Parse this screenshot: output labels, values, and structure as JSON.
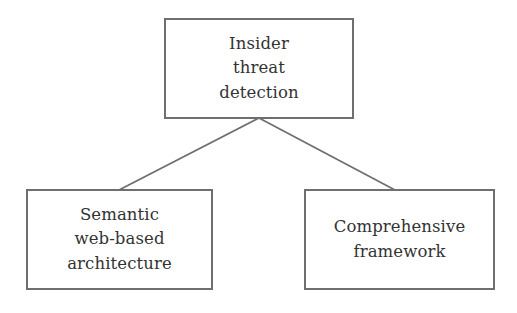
{
  "diagram": {
    "type": "tree",
    "colors": {
      "background": "#ffffff",
      "box_border": "#6f6f6f",
      "connector": "#6f6f6f",
      "text": "#333333"
    },
    "nodes": {
      "root": {
        "id": "insider-threat-detection",
        "label": "Insider\nthreat\ndetection"
      },
      "left": {
        "id": "semantic-web-based-architecture",
        "label": "Semantic\nweb-based\narchitecture"
      },
      "right": {
        "id": "comprehensive-framework",
        "label": "Comprehensive\nframework"
      }
    },
    "edges": [
      {
        "from": "Insider threat detection",
        "to": "Semantic web-based architecture"
      },
      {
        "from": "Insider threat detection",
        "to": "Comprehensive framework"
      }
    ]
  }
}
